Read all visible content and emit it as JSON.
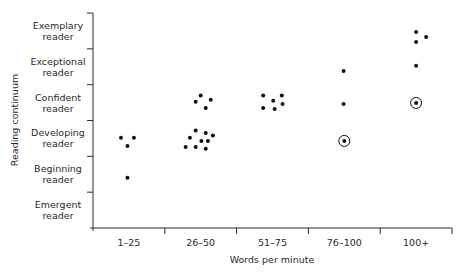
{
  "chart_data": {
    "type": "scatter",
    "title": "",
    "xlabel": "Words per minute",
    "ylabel": "Reading continuum",
    "x_categories": [
      "1–25",
      "26–50",
      "51–75",
      "76–100",
      "100+"
    ],
    "y_categories": [
      {
        "line1": "Emergent",
        "line2": "reader"
      },
      {
        "line1": "Beginning",
        "line2": "reader"
      },
      {
        "line1": "Developing",
        "line2": "reader"
      },
      {
        "line1": "Confident",
        "line2": "reader"
      },
      {
        "line1": "Exceptional",
        "line2": "reader"
      },
      {
        "line1": "Exemplary",
        "line2": "reader"
      }
    ],
    "ylim": [
      0,
      6
    ],
    "grid": false,
    "legend": null,
    "points": [
      {
        "cat": 0,
        "dx": -0.11,
        "y": 2.52,
        "circled": false
      },
      {
        "cat": 0,
        "dx": 0.07,
        "y": 2.52,
        "circled": false
      },
      {
        "cat": 0,
        "dx": -0.02,
        "y": 2.29,
        "circled": false
      },
      {
        "cat": 0,
        "dx": -0.02,
        "y": 1.4,
        "circled": false
      },
      {
        "cat": 1,
        "dx": 0.0,
        "y": 3.7,
        "circled": false
      },
      {
        "cat": 1,
        "dx": 0.14,
        "y": 3.58,
        "circled": false
      },
      {
        "cat": 1,
        "dx": -0.07,
        "y": 3.52,
        "circled": false
      },
      {
        "cat": 1,
        "dx": 0.07,
        "y": 3.35,
        "circled": false
      },
      {
        "cat": 1,
        "dx": -0.07,
        "y": 2.72,
        "circled": false
      },
      {
        "cat": 1,
        "dx": 0.07,
        "y": 2.65,
        "circled": false
      },
      {
        "cat": 1,
        "dx": -0.15,
        "y": 2.52,
        "circled": false
      },
      {
        "cat": 1,
        "dx": 0.17,
        "y": 2.58,
        "circled": false
      },
      {
        "cat": 1,
        "dx": 0.01,
        "y": 2.43,
        "circled": false
      },
      {
        "cat": 1,
        "dx": 0.1,
        "y": 2.43,
        "circled": false
      },
      {
        "cat": 1,
        "dx": -0.21,
        "y": 2.26,
        "circled": false
      },
      {
        "cat": 1,
        "dx": -0.07,
        "y": 2.26,
        "circled": false
      },
      {
        "cat": 1,
        "dx": 0.07,
        "y": 2.21,
        "circled": false
      },
      {
        "cat": 2,
        "dx": -0.13,
        "y": 3.7,
        "circled": false
      },
      {
        "cat": 2,
        "dx": 0.13,
        "y": 3.7,
        "circled": false
      },
      {
        "cat": 2,
        "dx": 0.01,
        "y": 3.55,
        "circled": false
      },
      {
        "cat": 2,
        "dx": 0.14,
        "y": 3.46,
        "circled": false
      },
      {
        "cat": 2,
        "dx": -0.13,
        "y": 3.35,
        "circled": false
      },
      {
        "cat": 2,
        "dx": 0.03,
        "y": 3.32,
        "circled": false
      },
      {
        "cat": 3,
        "dx": -0.01,
        "y": 4.38,
        "circled": false
      },
      {
        "cat": 3,
        "dx": -0.01,
        "y": 3.46,
        "circled": false
      },
      {
        "cat": 3,
        "dx": 0.0,
        "y": 2.43,
        "circled": true
      },
      {
        "cat": 4,
        "dx": 0.0,
        "y": 5.47,
        "circled": false
      },
      {
        "cat": 4,
        "dx": 0.14,
        "y": 5.33,
        "circled": false
      },
      {
        "cat": 4,
        "dx": 0.0,
        "y": 5.19,
        "circled": false
      },
      {
        "cat": 4,
        "dx": 0.0,
        "y": 4.53,
        "circled": false
      },
      {
        "cat": 4,
        "dx": 0.0,
        "y": 3.49,
        "circled": true
      }
    ]
  },
  "colors": {
    "axis": "#2a2a2a",
    "point": "#111111",
    "text": "#2a2a2a",
    "background": "#ffffff"
  }
}
